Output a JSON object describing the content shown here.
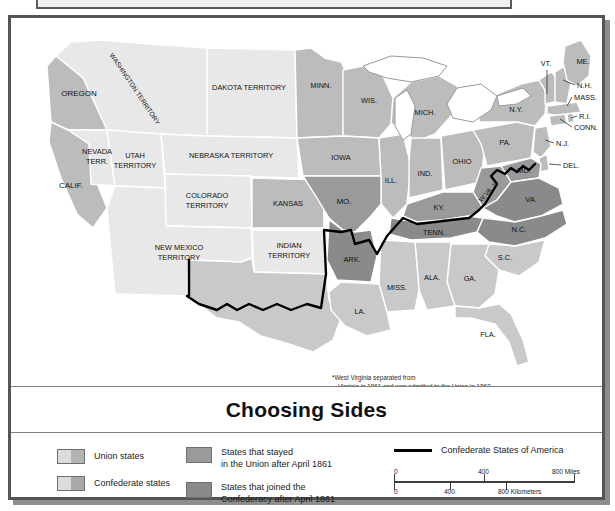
{
  "map": {
    "title": "Choosing Sides",
    "footnote_line1": "*West Virginia separated from",
    "footnote_line2": "Virginia in 1861 and was admitted to the Union in 1863.",
    "colors": {
      "territory": "#e8e8e8",
      "union": "#bcbcbc",
      "confederate": "#c9c9c9",
      "stayed_union": "#9a9a9a",
      "joined_confederacy": "#8a8a8a",
      "water": "#ffffff",
      "border": "#ffffff",
      "outline": "#5a5a5a",
      "csa_line": "#000000",
      "frame": "#555555",
      "shadow": "#8d8d8d"
    },
    "regions": [
      {
        "label": "WASHINGTON TERRITORY",
        "category": "territory"
      },
      {
        "label": "OREGON",
        "category": "union"
      },
      {
        "label": "CALIF.",
        "category": "union"
      },
      {
        "label": "NEVADA TERR.",
        "category": "territory"
      },
      {
        "label": "UTAH TERRITORY",
        "category": "territory"
      },
      {
        "label": "DAKOTA TERRITORY",
        "category": "territory"
      },
      {
        "label": "NEBRASKA TERRITORY",
        "category": "territory"
      },
      {
        "label": "COLORADO TERRITORY",
        "category": "territory"
      },
      {
        "label": "NEW MEXICO TERRITORY",
        "category": "territory"
      },
      {
        "label": "INDIAN TERRITORY",
        "category": "territory"
      },
      {
        "label": "KANSAS",
        "category": "union"
      },
      {
        "label": "MINN.",
        "category": "union"
      },
      {
        "label": "WIS.",
        "category": "union"
      },
      {
        "label": "IOWA",
        "category": "union"
      },
      {
        "label": "MICH.",
        "category": "union"
      },
      {
        "label": "ILL.",
        "category": "union"
      },
      {
        "label": "IND.",
        "category": "union"
      },
      {
        "label": "OHIO",
        "category": "union"
      },
      {
        "label": "PA.",
        "category": "union"
      },
      {
        "label": "N.Y.",
        "category": "union"
      },
      {
        "label": "VT.",
        "category": "union"
      },
      {
        "label": "ME.",
        "category": "union"
      },
      {
        "label": "N.H.",
        "category": "union"
      },
      {
        "label": "MASS.",
        "category": "union"
      },
      {
        "label": "R.I.",
        "category": "union"
      },
      {
        "label": "CONN.",
        "category": "union"
      },
      {
        "label": "N.J.",
        "category": "union"
      },
      {
        "label": "DEL.",
        "category": "union"
      },
      {
        "label": "MD.",
        "category": "stayed_union"
      },
      {
        "label": "W.VA. *",
        "category": "stayed_union"
      },
      {
        "label": "MO.",
        "category": "stayed_union"
      },
      {
        "label": "KY.",
        "category": "stayed_union"
      },
      {
        "label": "VA.",
        "category": "joined_confederacy"
      },
      {
        "label": "N.C.",
        "category": "joined_confederacy"
      },
      {
        "label": "TENN.",
        "category": "joined_confederacy"
      },
      {
        "label": "ARK.",
        "category": "joined_confederacy"
      },
      {
        "label": "S.C.",
        "category": "confederate"
      },
      {
        "label": "GA.",
        "category": "confederate"
      },
      {
        "label": "FLA.",
        "category": "confederate"
      },
      {
        "label": "ALA.",
        "category": "confederate"
      },
      {
        "label": "MISS.",
        "category": "confederate"
      },
      {
        "label": "LA.",
        "category": "confederate"
      },
      {
        "label": "TEXAS",
        "category": "confederate"
      }
    ]
  },
  "legend": {
    "items_col1": [
      {
        "label": "Union states",
        "swatch": "split-union"
      },
      {
        "label": "Confederate states",
        "swatch": "split-confederate"
      }
    ],
    "items_col2": [
      {
        "label": "States that stayed\nin the Union after April 1861",
        "swatch": "solid-stayed"
      },
      {
        "label": "States that joined the\nConfederacy after April 1861",
        "swatch": "solid-joined"
      }
    ],
    "csa_label": "Confederate States of America",
    "scale": {
      "miles_0": "0",
      "miles_400": "400",
      "miles_800": "800 Miles",
      "km_0": "0",
      "km_400": "400",
      "km_800": "800 Kilometers"
    }
  }
}
